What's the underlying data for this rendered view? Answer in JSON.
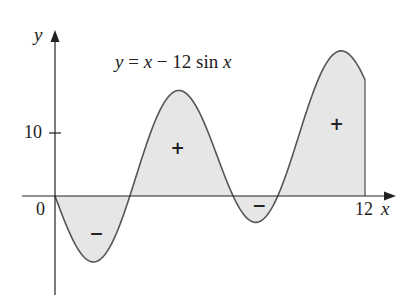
{
  "chart_data": {
    "type": "area",
    "title": "y = x − 12 sin x",
    "function": "y = x - 12 sin x",
    "xlabel": "x",
    "ylabel": "y",
    "x_range": [
      0,
      12
    ],
    "xlim": [
      -0.4,
      13.0
    ],
    "ylim": [
      -18.5,
      23.5
    ],
    "x_ticks": [
      {
        "value": 0,
        "label": "0"
      },
      {
        "value": 12,
        "label": "12"
      }
    ],
    "y_ticks": [
      {
        "value": 10,
        "label": "10"
      }
    ],
    "grid": false,
    "legend": null,
    "fill_color": "#e6e6e6",
    "line_color": "#555555",
    "region_signs": [
      {
        "x": 1.6,
        "y": -5.8,
        "sign": "−"
      },
      {
        "x": 4.75,
        "y": 7.6,
        "sign": "+"
      },
      {
        "x": 7.9,
        "y": -1.4,
        "sign": "−"
      },
      {
        "x": 10.9,
        "y": 11.5,
        "sign": "+"
      }
    ],
    "sample_points": [
      {
        "x": 0,
        "y": 0
      },
      {
        "x": 1.5,
        "y": -10.47
      },
      {
        "x": 2.5,
        "y": -4.68
      },
      {
        "x": 3.14,
        "y": 3.14
      },
      {
        "x": 4.5,
        "y": 16.23
      },
      {
        "x": 6.0,
        "y": 9.35
      },
      {
        "x": 7.5,
        "y": -4.21
      },
      {
        "x": 8.5,
        "y": 0.16
      },
      {
        "x": 10.5,
        "y": 21.53
      },
      {
        "x": 11.0,
        "y": 22.99
      },
      {
        "x": 12,
        "y": 18.44
      }
    ]
  },
  "labels": {
    "equation_y": "y",
    "equation_rest": " = ",
    "equation_x": "x",
    "equation_minus": " − 12 sin ",
    "equation_x2": "x",
    "y_axis": "y",
    "x_axis": "x",
    "origin": "0",
    "x_tick_12": "12",
    "y_tick_10": "10"
  }
}
